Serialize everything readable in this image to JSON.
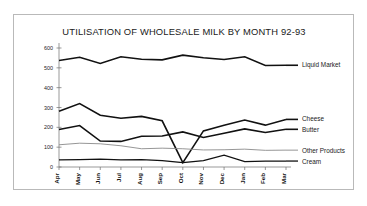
{
  "chart_data": {
    "type": "line",
    "title": "UTILISATION OF WHOLESALE MILK BY MONTH 92-93",
    "xlabel": "",
    "ylabel": "",
    "ylim": [
      0,
      600
    ],
    "yticks": [
      0,
      100,
      200,
      300,
      400,
      500,
      600
    ],
    "grid": false,
    "legend_position": "right-inline-labels",
    "categories": [
      "Apr",
      "May",
      "Jun",
      "Jul",
      "Aug",
      "Sep",
      "Oct",
      "Nov",
      "Dec",
      "Jan",
      "Feb",
      "Mar"
    ],
    "series": [
      {
        "name": "Liquid Market",
        "color": "#111111",
        "width": 1.6,
        "values": [
          537,
          553,
          522,
          556,
          543,
          540,
          564,
          551,
          542,
          556,
          512,
          513
        ]
      },
      {
        "name": "Cheese",
        "color": "#111111",
        "width": 1.6,
        "values": [
          281,
          320,
          261,
          246,
          255,
          233,
          22,
          182,
          211,
          237,
          211,
          240
        ]
      },
      {
        "name": "Butter",
        "color": "#111111",
        "width": 1.6,
        "values": [
          189,
          209,
          131,
          129,
          155,
          156,
          177,
          149,
          170,
          192,
          174,
          190
        ]
      },
      {
        "name": "Other Products",
        "color": "#8a8a8a",
        "width": 0.9,
        "values": [
          112,
          120,
          117,
          107,
          92,
          95,
          92,
          86,
          87,
          90,
          84,
          85
        ]
      },
      {
        "name": "Cream",
        "color": "#111111",
        "width": 1.3,
        "values": [
          36,
          37,
          40,
          36,
          37,
          32,
          22,
          32,
          60,
          27,
          30,
          30
        ]
      }
    ]
  }
}
